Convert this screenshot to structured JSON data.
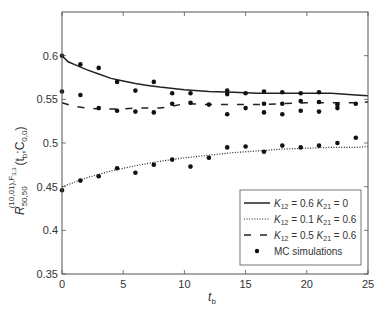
{
  "chart_data": {
    "type": "line",
    "title": "",
    "xlabel": "t_b",
    "ylabel": "R_{50,50}^{(10,01),F_{3,3}}(t_b; C_{0,0})",
    "xlim": [
      0,
      25
    ],
    "ylim": [
      0.35,
      0.65
    ],
    "x_ticks": [
      0,
      5,
      10,
      15,
      20,
      25
    ],
    "y_ticks": [
      0.35,
      0.4,
      0.45,
      0.5,
      0.55,
      0.6
    ],
    "grid": false,
    "legend_position": "lower right",
    "series": [
      {
        "name": "K12 = 0.6 K21 = 0",
        "style": "solid",
        "x": [
          0,
          0.5,
          1,
          2,
          3,
          4,
          5,
          6,
          7,
          8,
          10,
          12,
          14,
          16,
          18,
          20,
          22,
          24,
          25
        ],
        "y": [
          0.6,
          0.593,
          0.59,
          0.584,
          0.579,
          0.574,
          0.571,
          0.568,
          0.566,
          0.564,
          0.561,
          0.559,
          0.558,
          0.557,
          0.557,
          0.557,
          0.557,
          0.555,
          0.554
        ]
      },
      {
        "name": "K12 = 0.1 K21 = 0.6",
        "style": "dotted",
        "x": [
          0,
          2,
          4,
          6,
          8,
          10,
          12,
          14,
          16,
          18,
          20,
          22,
          24,
          25
        ],
        "y": [
          0.45,
          0.46,
          0.468,
          0.474,
          0.479,
          0.483,
          0.486,
          0.489,
          0.491,
          0.493,
          0.494,
          0.495,
          0.495,
          0.496
        ]
      },
      {
        "name": "K12 = 0.5 K21 = 0.6",
        "style": "dashed",
        "x": [
          0,
          1,
          2,
          3,
          4,
          5,
          6,
          7,
          8,
          9,
          10,
          12,
          14,
          16,
          18,
          20,
          22,
          24,
          25
        ],
        "y": [
          0.546,
          0.542,
          0.54,
          0.539,
          0.539,
          0.539,
          0.54,
          0.54,
          0.54,
          0.542,
          0.545,
          0.544,
          0.544,
          0.544,
          0.545,
          0.546,
          0.546,
          0.546,
          0.547
        ]
      }
    ],
    "scatter": {
      "name": "MC simulations",
      "points": [
        [
          0,
          0.6
        ],
        [
          1.5,
          0.59
        ],
        [
          3,
          0.586
        ],
        [
          4.5,
          0.57
        ],
        [
          7.5,
          0.57
        ],
        [
          13.5,
          0.56
        ],
        [
          16.5,
          0.559
        ],
        [
          18,
          0.558
        ],
        [
          21,
          0.558
        ],
        [
          0,
          0.559
        ],
        [
          1.5,
          0.555
        ],
        [
          4.5,
          0.537
        ],
        [
          6,
          0.56
        ],
        [
          9,
          0.557
        ],
        [
          10.5,
          0.557
        ],
        [
          13.5,
          0.556
        ],
        [
          15,
          0.557
        ],
        [
          19.5,
          0.557
        ],
        [
          22.5,
          0.54
        ],
        [
          3,
          0.54
        ],
        [
          6,
          0.536
        ],
        [
          9,
          0.545
        ],
        [
          10.5,
          0.546
        ],
        [
          12,
          0.544
        ],
        [
          19.5,
          0.548
        ],
        [
          21,
          0.547
        ],
        [
          22.5,
          0.544
        ],
        [
          24,
          0.545
        ],
        [
          7.5,
          0.535
        ],
        [
          13.5,
          0.533
        ],
        [
          16.5,
          0.535
        ],
        [
          18,
          0.533
        ],
        [
          19.5,
          0.537
        ],
        [
          21,
          0.536
        ],
        [
          15,
          0.54
        ],
        [
          16.5,
          0.545
        ],
        [
          18,
          0.545
        ],
        [
          0,
          0.446
        ],
        [
          1.5,
          0.457
        ],
        [
          3,
          0.462
        ],
        [
          4.5,
          0.471
        ],
        [
          6,
          0.466
        ],
        [
          7.5,
          0.475
        ],
        [
          9,
          0.481
        ],
        [
          10.5,
          0.473
        ],
        [
          12,
          0.483
        ],
        [
          13.5,
          0.495
        ],
        [
          15,
          0.496
        ],
        [
          16.5,
          0.49
        ],
        [
          18,
          0.497
        ],
        [
          19.5,
          0.495
        ],
        [
          21,
          0.497
        ],
        [
          22.5,
          0.5
        ],
        [
          24,
          0.506
        ]
      ]
    }
  },
  "axes": {
    "xlabel_main": "t",
    "xlabel_sub": "b",
    "ylabel_main": "R",
    "ylabel_sub": "50,50",
    "ylabel_sup": "(10,01),F",
    "ylabel_sup_sub": "3,3",
    "ylabel_args": "(t",
    "ylabel_args_sub": "b",
    "ylabel_args2": ";C",
    "ylabel_args2_sub": "0,0",
    "ylabel_close": ")"
  },
  "legend": {
    "entries": [
      {
        "k12": "0.6",
        "k21": "0",
        "style": "solid"
      },
      {
        "k12": "0.1",
        "k21": "0.6",
        "style": "dotted"
      },
      {
        "k12": "0.5",
        "k21": "0.6",
        "style": "dashed"
      },
      {
        "label": "MC simulations",
        "style": "marker"
      }
    ]
  },
  "colors": {
    "line": "#222222",
    "axis": "#555555",
    "text": "#333333",
    "marker": "#111111"
  }
}
